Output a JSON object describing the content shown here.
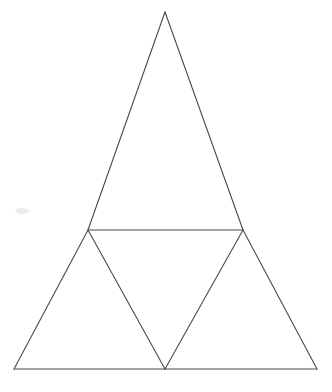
{
  "figure": {
    "canvas": {
      "width": 392,
      "height": 392,
      "background_color": "#ffffff"
    },
    "style": {
      "stroke_color": "#4a4a4a",
      "stroke_width": 1.1,
      "fill_color": "none"
    },
    "points": {
      "apex": {
        "label": "apex",
        "x": 165,
        "y": 12
      },
      "bottom_left": {
        "label": "bottom-left",
        "x": 14,
        "y": 369
      },
      "bottom_right": {
        "label": "bottom-right",
        "x": 317,
        "y": 369
      },
      "left_mid": {
        "label": "left-midpoint",
        "x": 88,
        "y": 230
      },
      "right_mid": {
        "label": "right-midpoint",
        "x": 243,
        "y": 230
      },
      "bottom_mid": {
        "label": "bottom-midpoint",
        "x": 165,
        "y": 369
      }
    },
    "edges": [
      {
        "name": "outer-left-upper",
        "from": "apex",
        "to": "left_mid"
      },
      {
        "name": "outer-left-lower",
        "from": "left_mid",
        "to": "bottom_left"
      },
      {
        "name": "outer-right-upper",
        "from": "apex",
        "to": "right_mid"
      },
      {
        "name": "outer-right-lower",
        "from": "right_mid",
        "to": "bottom_right"
      },
      {
        "name": "outer-base-left",
        "from": "bottom_left",
        "to": "bottom_mid"
      },
      {
        "name": "outer-base-right",
        "from": "bottom_mid",
        "to": "bottom_right"
      },
      {
        "name": "midsegment-horizontal",
        "from": "left_mid",
        "to": "right_mid"
      },
      {
        "name": "cevian-left",
        "from": "left_mid",
        "to": "bottom_mid"
      },
      {
        "name": "cevian-right",
        "from": "right_mid",
        "to": "bottom_mid"
      }
    ],
    "regions": [
      {
        "name": "upper-triangle",
        "vertices": [
          "apex",
          "left_mid",
          "right_mid"
        ]
      },
      {
        "name": "lower-left-triangle",
        "vertices": [
          "left_mid",
          "bottom_left",
          "bottom_mid"
        ]
      },
      {
        "name": "lower-right-triangle",
        "vertices": [
          "right_mid",
          "bottom_mid",
          "bottom_right"
        ]
      },
      {
        "name": "central-inverted-triangle",
        "vertices": [
          "left_mid",
          "right_mid",
          "bottom_mid"
        ]
      }
    ],
    "artifacts": [
      {
        "name": "scan-smudge",
        "x": 22,
        "y": 211,
        "rx": 7,
        "ry": 3
      }
    ]
  }
}
